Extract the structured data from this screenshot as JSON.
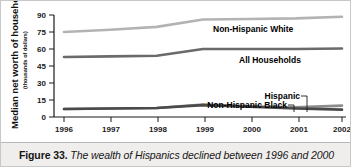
{
  "figure": {
    "caption_label": "Figure 33.",
    "caption_body": "The wealth of Hispanics declined between 1996 and 2000"
  },
  "axis": {
    "ylabel_main": "Median net worth of households",
    "ylabel_sub": "(thousands of dollars)",
    "y_ticks": [
      "0",
      "15",
      "30",
      "45",
      "60",
      "75",
      "90"
    ],
    "x_ticks": [
      "1996",
      "1997",
      "1998",
      "1999",
      "2000",
      "2001",
      "2002"
    ]
  },
  "series_labels": {
    "white": "Non-Hispanic White",
    "all": "All Households",
    "hispanic": "Hispanic",
    "black": "Non-Hispanic Black"
  },
  "colors": {
    "white_line": "#b3b3b3",
    "all_line": "#6a6a6a",
    "hispanic_line": "#8c8c8c",
    "black_line": "#4a4a4a",
    "axis": "#1a1a1a",
    "caption_bg": "#f0eeec"
  },
  "chart_data": {
    "type": "line",
    "title": "",
    "xlabel": "",
    "ylabel": "Median net worth of households (thousands of dollars)",
    "categories": [
      "1996",
      "1997",
      "1998",
      "1999",
      "2000",
      "2001",
      "2002"
    ],
    "x": [
      1996,
      1997,
      1998,
      1999,
      2000,
      2001,
      2002
    ],
    "xlim": [
      1996,
      2002
    ],
    "ylim": [
      0,
      90
    ],
    "y_ticks": [
      0,
      15,
      30,
      45,
      60,
      75,
      90
    ],
    "grid": false,
    "legend": "inline-labels",
    "series": [
      {
        "name": "Non-Hispanic White",
        "color": "#b3b3b3",
        "values": [
          75,
          77,
          79.5,
          86,
          86.5,
          87,
          88.5
        ]
      },
      {
        "name": "All Households",
        "color": "#6a6a6a",
        "values": [
          53,
          53.5,
          54,
          60,
          60,
          60,
          60.5
        ]
      },
      {
        "name": "Hispanic",
        "color": "#8c8c8c",
        "values": [
          7,
          7.5,
          8,
          11,
          9.5,
          8.5,
          10
        ]
      },
      {
        "name": "Non-Hispanic Black",
        "color": "#4a4a4a",
        "values": [
          7,
          7.5,
          8,
          10.5,
          9,
          7.5,
          6.5
        ]
      }
    ],
    "annotations": [
      "Non-Hispanic White",
      "All Households",
      "Hispanic",
      "Non-Hispanic Black"
    ]
  }
}
